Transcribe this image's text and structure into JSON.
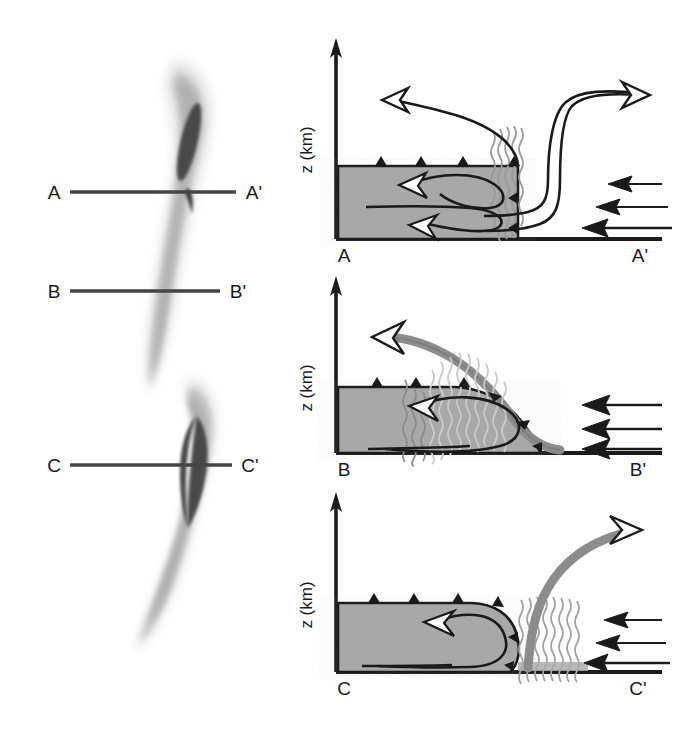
{
  "figure": {
    "type": "conceptual-diagram",
    "background_color": "#ffffff"
  },
  "colors": {
    "cold_air_fill": "#a8a8a8",
    "outline": "#1a1a1a",
    "flow_band": "#8c8c8c",
    "precip_wave": "#9a9a9a",
    "reflectivity_light": "#dcdcdc",
    "reflectivity_mid": "#b4b4b4",
    "reflectivity_core": "#4a4a4a",
    "section_line": "#444444",
    "text": "#1a1a1a"
  },
  "plan_views": [
    {
      "name": "plan-view-upper",
      "section_lines": [
        {
          "left_label": "A",
          "right_label": "A'"
        },
        {
          "left_label": "B",
          "right_label": "B'"
        }
      ]
    },
    {
      "name": "plan-view-lower",
      "section_lines": [
        {
          "left_label": "C",
          "right_label": "C'"
        }
      ]
    }
  ],
  "cross_sections": [
    {
      "id": "section-aa",
      "axis_label": "z (km)",
      "left_label": "A",
      "right_label": "A'",
      "features": {
        "cold_pool": "shaded gray cold air with cold-front barbs along top",
        "precipitation": "vertical wavy shaft above leading edge",
        "rear_inflow": "descending jet entering from right turning into cold pool",
        "front_to_rear_flow": "ascending flow exiting to upper left with open arrowhead",
        "overturning_updraft": "open arrow curling rearward within cold pool",
        "inflow_arrows": 3
      }
    },
    {
      "id": "section-bb",
      "axis_label": "z (km)",
      "left_label": "B",
      "right_label": "B'",
      "features": {
        "cold_pool": "deep shaded gray cold air with cold-front barbs along top",
        "precipitation": "sloping wavy precipitation band over cold pool nose",
        "front_to_rear_flow": "gray band rising from right along frontal surface, open arrowhead upper left",
        "overturning_updraft": "open arrow curling rearward within cold pool",
        "inflow_arrows": 3
      }
    },
    {
      "id": "section-cc",
      "axis_label": "z (km)",
      "left_label": "C",
      "right_label": "C'",
      "features": {
        "cold_pool": "shallow, flat-topped gray cold air with cold-front barbs along top",
        "precipitation": "upright wavy precipitation shaft ahead of gust front",
        "updraft": "gray band rising steeply to upper right with open arrowhead",
        "overturning_updraft": "open arrow curling rearward within cold pool",
        "inflow_arrows": 3
      }
    }
  ]
}
